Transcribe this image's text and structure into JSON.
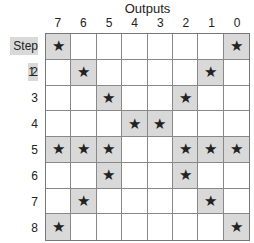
{
  "title": "Outputs",
  "columns": [
    "7",
    "6",
    "5",
    "4",
    "3",
    "2",
    "1",
    "0"
  ],
  "rows": [
    {
      "label": "Step 1",
      "marks": [
        1,
        0,
        0,
        0,
        0,
        0,
        0,
        1
      ]
    },
    {
      "label": "2",
      "marks": [
        0,
        1,
        0,
        0,
        0,
        0,
        1,
        0
      ]
    },
    {
      "label": "3",
      "marks": [
        0,
        0,
        1,
        0,
        0,
        1,
        0,
        0
      ]
    },
    {
      "label": "4",
      "marks": [
        0,
        0,
        0,
        1,
        1,
        0,
        0,
        0
      ]
    },
    {
      "label": "5",
      "marks": [
        1,
        1,
        1,
        0,
        0,
        1,
        1,
        1
      ]
    },
    {
      "label": "6",
      "marks": [
        0,
        0,
        1,
        0,
        0,
        1,
        0,
        0
      ]
    },
    {
      "label": "7",
      "marks": [
        0,
        1,
        0,
        0,
        0,
        0,
        1,
        0
      ]
    },
    {
      "label": "8",
      "marks": [
        1,
        0,
        0,
        0,
        0,
        0,
        0,
        1
      ]
    }
  ],
  "mark_symbol": "★",
  "colors": {
    "highlight": "#d9d9d9",
    "grid": "#888888"
  }
}
